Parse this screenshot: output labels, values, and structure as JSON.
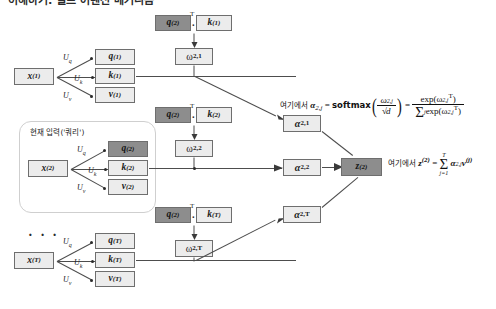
{
  "figure": {
    "title_partial": "이해하기: 셀프 어텐션 메커니즘",
    "highlight_label": "현재 입력('쿼리')",
    "ellipsis": "· · ·",
    "colors": {
      "box_light": "#e2e2e2",
      "box_dark": "#8d8d8d",
      "box_mid": "#b8b8b8",
      "border": "#6e6e6e",
      "line": "#4d4d4d",
      "highlight_border": "#cfcfcf"
    }
  },
  "inputs": [
    {
      "name": "x1",
      "label": "x",
      "sup": "(1)",
      "u": [
        {
          "label": "U",
          "sub": "q"
        },
        {
          "label": "U",
          "sub": "k"
        },
        {
          "label": "U",
          "sub": "v"
        }
      ],
      "outs": [
        {
          "name": "q1",
          "label": "q",
          "sup": "(1)",
          "shade": "light"
        },
        {
          "name": "k1",
          "label": "k",
          "sup": "(1)",
          "shade": "light"
        },
        {
          "name": "v1",
          "label": "v",
          "sup": "(1)",
          "shade": "light"
        }
      ]
    },
    {
      "name": "x2",
      "label": "x",
      "sup": "(2)",
      "u": [
        {
          "label": "U",
          "sub": "q"
        },
        {
          "label": "U",
          "sub": "k"
        },
        {
          "label": "U",
          "sub": "v"
        }
      ],
      "outs": [
        {
          "name": "q2",
          "label": "q",
          "sup": "(2)",
          "shade": "dark"
        },
        {
          "name": "k2",
          "label": "k",
          "sup": "(2)",
          "shade": "light"
        },
        {
          "name": "v2",
          "label": "v",
          "sup": "(2)",
          "shade": "light"
        }
      ]
    },
    {
      "name": "xT",
      "label": "x",
      "sup": "(T)",
      "u": [
        {
          "label": "U",
          "sub": "q"
        },
        {
          "label": "U",
          "sub": "k"
        },
        {
          "label": "U",
          "sub": "v"
        }
      ],
      "outs": [
        {
          "name": "qT",
          "label": "q",
          "sup": "(T)",
          "shade": "light"
        },
        {
          "name": "kT",
          "label": "k",
          "sup": "(T)",
          "shade": "light"
        },
        {
          "name": "vT",
          "label": "v",
          "sup": "(T)",
          "shade": "light"
        }
      ]
    }
  ],
  "dot_products": [
    {
      "name": "dot-1",
      "q": "q",
      "q_sup": "(2)",
      "t": "T",
      "dot": "·",
      "k": "k",
      "k_sup": "(1)"
    },
    {
      "name": "dot-2",
      "q": "q",
      "q_sup": "(2)",
      "t": "T",
      "dot": "·",
      "k": "k",
      "k_sup": "(2)"
    },
    {
      "name": "dot-T",
      "q": "q",
      "q_sup": "(2)",
      "t": "T",
      "dot": "·",
      "k": "k",
      "k_sup": "(T)"
    }
  ],
  "omegas": [
    {
      "name": "omega-2-1",
      "sym": "ω",
      "sub": "2,1"
    },
    {
      "name": "omega-2-2",
      "sym": "ω",
      "sub": "2,2"
    },
    {
      "name": "omega-2-T",
      "sym": "ω",
      "sub": "2,T"
    }
  ],
  "alphas": [
    {
      "name": "alpha-2-1",
      "sym": "α",
      "sub": "2,1"
    },
    {
      "name": "alpha-2-2",
      "sym": "α",
      "sub": "2,2"
    },
    {
      "name": "alpha-2-T",
      "sym": "α",
      "sub": "2,T"
    }
  ],
  "output": {
    "name": "z2",
    "label": "z",
    "sup": "(2)"
  },
  "formula_alpha": {
    "prefix": "여기에서",
    "lhs_sym": "α",
    "lhs_sub": "2,j",
    "eq": "=",
    "func": "softmax",
    "arg_num_sym": "ω",
    "arg_num_sub": "2,j",
    "arg_den": "d",
    "eq2": "=",
    "rhs_num": "exp(ω",
    "rhs_num_sub": "2,j",
    "rhs_num_sup": "T",
    "rhs_num_close": ")",
    "rhs_den_sigma": "Σ",
    "rhs_den_sigma_sub": "j",
    "rhs_den_exp": "exp(ω",
    "rhs_den_sub": "2,j",
    "rhs_den_sup": "T",
    "rhs_den_close": ")"
  },
  "formula_z": {
    "prefix": "여기에서",
    "lhs": "z",
    "lhs_sup": "(2)",
    "eq": "=",
    "sum_top": "T",
    "sum_sym": "Σ",
    "sum_bottom": "j=1",
    "term_alpha": "α",
    "term_alpha_sub": "2,j",
    "term_v": "v",
    "term_v_sup": "(j)"
  }
}
